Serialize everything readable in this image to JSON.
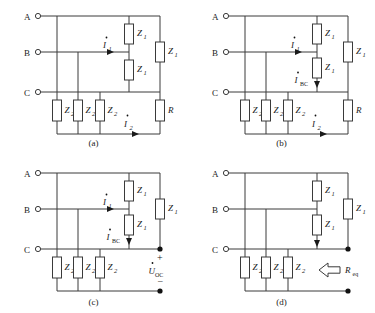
{
  "figure": {
    "type": "circuit-diagram-set",
    "panel_count": 4
  },
  "terminals": {
    "a_label": "A",
    "b_label": "B",
    "c_label": "C"
  },
  "components": {
    "z1": "Z",
    "z1_sub": "1",
    "z2": "Z",
    "z2_sub": "2",
    "r": "R",
    "req": "R",
    "req_sub": "eq"
  },
  "currents": {
    "i1": "I",
    "i1_sub": "1",
    "i2": "I",
    "i2_sub": "2",
    "ibc": "I",
    "ibc_sub": "BC"
  },
  "voltages": {
    "uoc": "U",
    "uoc_sub": "OC",
    "plus": "+",
    "minus": "−"
  },
  "panels": [
    {
      "id": "a",
      "caption": "(a)",
      "has_i1": true,
      "has_i2": true,
      "has_ibc": false,
      "has_uoc": false,
      "has_req": false,
      "has_r": true,
      "z2_count": 3,
      "z1_count": 3
    },
    {
      "id": "b",
      "caption": "(b)",
      "has_i1": true,
      "has_i2": true,
      "has_ibc": true,
      "has_uoc": false,
      "has_req": false,
      "has_r": true,
      "z2_count": 3,
      "z1_count": 3
    },
    {
      "id": "c",
      "caption": "(c)",
      "has_i1": true,
      "has_i2": false,
      "has_ibc": true,
      "has_uoc": true,
      "has_req": false,
      "has_r": false,
      "z2_count": 3,
      "z1_count": 3
    },
    {
      "id": "d",
      "caption": "(d)",
      "has_i1": false,
      "has_i2": false,
      "has_ibc": false,
      "has_uoc": false,
      "has_req": true,
      "has_r": false,
      "z2_count": 3,
      "z1_count": 3
    }
  ],
  "colors": {
    "background": "#ffffff",
    "wire": "#3a3a3a",
    "node": "#111111",
    "text": "#1a1a1a"
  }
}
